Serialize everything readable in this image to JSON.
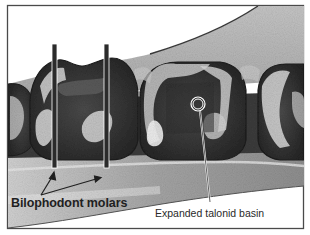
{
  "figure": {
    "type": "annotated scientific illustration",
    "colors": {
      "frame": "#4a4a4a",
      "background": "#ffffff",
      "bone": "#b9b9b9",
      "tooth_dark": "#3a3a3a",
      "tooth_light": "#d6d6d6",
      "marker_bar": "#2b2b2b"
    }
  },
  "annotations": {
    "bilophodont": {
      "label": "Bilophodont molars",
      "marker": "two vertical bars",
      "arrow_count": 2
    },
    "talonid": {
      "label": "Expanded talonid basin",
      "marker": "circle"
    }
  }
}
